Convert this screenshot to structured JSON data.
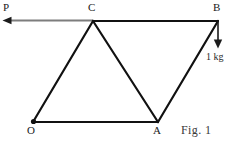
{
  "figure": {
    "caption": "Fig. 1",
    "vertices": [
      {
        "id": "O",
        "label": "O",
        "x": 33,
        "y": 122
      },
      {
        "id": "A",
        "label": "A",
        "x": 158,
        "y": 122
      },
      {
        "id": "B",
        "label": "B",
        "x": 218,
        "y": 21
      },
      {
        "id": "C",
        "label": "C",
        "x": 93,
        "y": 21
      }
    ],
    "force_arrow": {
      "label": "P",
      "direction": "left",
      "from": "C",
      "tip_x": 3,
      "tip_y": 20,
      "color": "#7d7d7d"
    },
    "load_arrow": {
      "label": "1 kg",
      "direction": "down",
      "from": "B",
      "tip_x": 218,
      "tip_y": 48,
      "color": "#1a1a1a"
    },
    "edges": [
      {
        "from": "O",
        "to": "A",
        "name": "edge-O-A"
      },
      {
        "from": "A",
        "to": "B",
        "name": "edge-A-B"
      },
      {
        "from": "B",
        "to": "C",
        "name": "edge-B-C"
      },
      {
        "from": "C",
        "to": "O",
        "name": "edge-C-O"
      },
      {
        "from": "C",
        "to": "A",
        "name": "diagonal-C-A"
      }
    ],
    "line_color": "#111111",
    "line_width": 2.2
  }
}
